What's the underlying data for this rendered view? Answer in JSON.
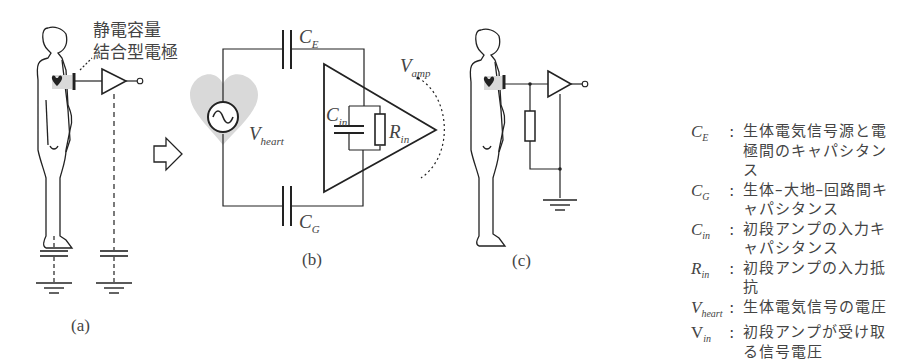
{
  "panel_a": {
    "electrode_label_line1": "静電容量",
    "electrode_label_line2": "結合型電極",
    "caption": "(a)"
  },
  "panel_b": {
    "labels": {
      "ce": {
        "base": "C",
        "sub": "E"
      },
      "cg": {
        "base": "C",
        "sub": "G"
      },
      "cin": {
        "base": "C",
        "sub": "in"
      },
      "rin": {
        "base": "R",
        "sub": "in"
      },
      "vheart": {
        "base": "V",
        "sub": "heart"
      },
      "vamp": {
        "base": "V",
        "sub": "amp"
      }
    },
    "caption": "(b)"
  },
  "panel_c": {
    "caption": "(c)"
  },
  "legend": {
    "items": [
      {
        "sym": "C",
        "sub": "E",
        "desc": "生体電気信号源と電極間のキャパシタンス"
      },
      {
        "sym": "C",
        "sub": "G",
        "desc": "生体–大地–回路間キャパシタンス"
      },
      {
        "sym": "C",
        "sub": "in",
        "desc": "初段アンプの入力キャパシタンス"
      },
      {
        "sym": "R",
        "sub": "in",
        "desc": "初段アンプの入力抵抗"
      },
      {
        "sym": "V",
        "sub": "heart",
        "desc": "生体電気信号の電圧"
      },
      {
        "sym": "V",
        "sub": "in",
        "desc": "初段アンプが受け取る信号電圧"
      }
    ],
    "colon": ":"
  },
  "colors": {
    "line": "#222222",
    "heart_fill": "#d9d9d9",
    "text": "#444444"
  }
}
